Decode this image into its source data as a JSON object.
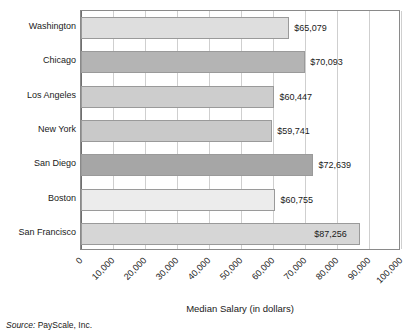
{
  "chart_data": {
    "type": "bar",
    "orientation": "horizontal",
    "title": "",
    "xlabel": "Median Salary (in dollars)",
    "ylabel": "",
    "xlim": [
      0,
      100000
    ],
    "xtick_values": [
      0,
      10000,
      20000,
      30000,
      40000,
      50000,
      60000,
      70000,
      80000,
      90000,
      100000
    ],
    "xtick_labels": [
      "0",
      "10,000",
      "20,000",
      "30,000",
      "40,000",
      "50,000",
      "60,000",
      "70,000",
      "80,000",
      "90,000",
      "100,000"
    ],
    "grid": true,
    "legend": false,
    "categories": [
      "Washington",
      "Chicago",
      "Los Angeles",
      "New York",
      "San Diego",
      "Boston",
      "San Francisco"
    ],
    "values": [
      65079,
      70093,
      60447,
      59741,
      72639,
      60755,
      87256
    ],
    "data_labels": [
      "$65,079",
      "$70,093",
      "$60,447",
      "$59,741",
      "$72,639",
      "$60,755",
      "$87,256"
    ],
    "bar_colors": [
      "#dedede",
      "#b4b4b4",
      "#cdcdcd",
      "#c9c9c9",
      "#a6a6a6",
      "#ececec",
      "#d6d6d6"
    ],
    "label_placement": [
      "outside",
      "outside",
      "outside",
      "outside",
      "outside",
      "outside",
      "inside"
    ],
    "bars": [
      {
        "category": "Washington",
        "value": 65079,
        "label": "$65,079",
        "color": "#dedede",
        "label_placement": "outside"
      },
      {
        "category": "Chicago",
        "value": 70093,
        "label": "$70,093",
        "color": "#b4b4b4",
        "label_placement": "outside"
      },
      {
        "category": "Los Angeles",
        "value": 60447,
        "label": "$60,447",
        "color": "#cdcdcd",
        "label_placement": "outside"
      },
      {
        "category": "New York",
        "value": 59741,
        "label": "$59,741",
        "color": "#c9c9c9",
        "label_placement": "outside"
      },
      {
        "category": "San Diego",
        "value": 72639,
        "label": "$72,639",
        "color": "#a6a6a6",
        "label_placement": "outside"
      },
      {
        "category": "Boston",
        "value": 60755,
        "label": "$60,755",
        "color": "#ececec",
        "label_placement": "outside"
      },
      {
        "category": "San Francisco",
        "value": 87256,
        "label": "$87,256",
        "color": "#d6d6d6",
        "label_placement": "inside"
      }
    ]
  },
  "axis_title": "Median Salary (in dollars)",
  "source": {
    "prefix": "Source:",
    "text": "PayScale, Inc."
  },
  "colors": {
    "grid": "#cfcfcf",
    "frame": "#8a8a8a",
    "bar_edge": "#9a9a9a",
    "text": "#1a1a1a"
  }
}
